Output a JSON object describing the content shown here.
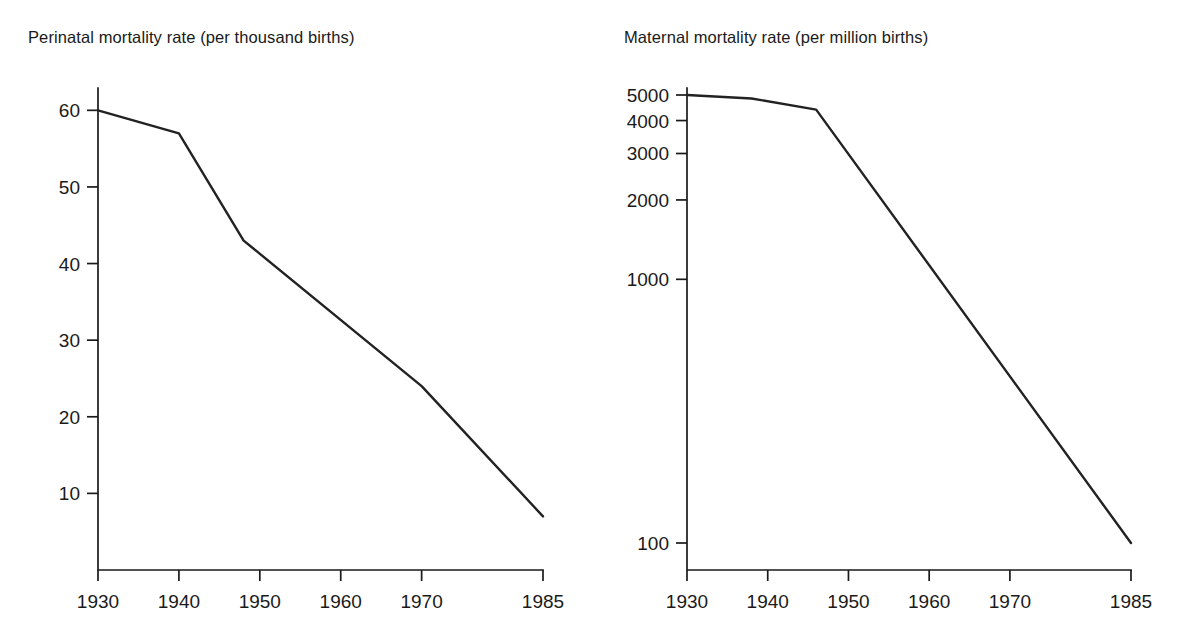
{
  "figure": {
    "background_color": "#ffffff",
    "line_color": "#222222",
    "axis_color": "#1a1a1a"
  },
  "chart_data": [
    {
      "id": "perinatal",
      "type": "line",
      "title": "Perinatal mortality rate (per thousand births)",
      "xlabel": "",
      "ylabel": "",
      "grid": false,
      "legend": "none",
      "xscale": "linear",
      "yscale": "linear",
      "xlim": [
        1930,
        1985
      ],
      "ylim": [
        0,
        62
      ],
      "xticks": [
        1930,
        1940,
        1950,
        1960,
        1970,
        1985
      ],
      "xtick_labels": [
        "1930",
        "1940",
        "1950",
        "1960",
        "1970",
        "1985"
      ],
      "yticks": [
        10,
        20,
        30,
        40,
        50,
        60
      ],
      "ytick_labels": [
        "10",
        "20",
        "30",
        "40",
        "50",
        "60"
      ],
      "series": [
        {
          "name": "Perinatal mortality rate",
          "x": [
            1930,
            1940,
            1948,
            1970,
            1985
          ],
          "values": [
            60,
            57,
            43,
            24,
            7
          ]
        }
      ]
    },
    {
      "id": "maternal",
      "type": "line",
      "title": "Maternal mortality rate (per million births)",
      "xlabel": "",
      "ylabel": "",
      "grid": false,
      "legend": "none",
      "xscale": "linear",
      "yscale": "log",
      "xlim": [
        1930,
        1985
      ],
      "ylim": [
        100,
        5000
      ],
      "xticks": [
        1930,
        1940,
        1950,
        1960,
        1970,
        1985
      ],
      "xtick_labels": [
        "1930",
        "1940",
        "1950",
        "1960",
        "1970",
        "1985"
      ],
      "yticks": [
        100,
        1000,
        2000,
        3000,
        4000,
        5000
      ],
      "ytick_labels": [
        "100",
        "1000",
        "2000",
        "3000",
        "4000",
        "5000"
      ],
      "series": [
        {
          "name": "Maternal mortality rate",
          "x": [
            1930,
            1938,
            1946,
            1985
          ],
          "values": [
            5000,
            4850,
            4400,
            100
          ]
        }
      ]
    }
  ]
}
